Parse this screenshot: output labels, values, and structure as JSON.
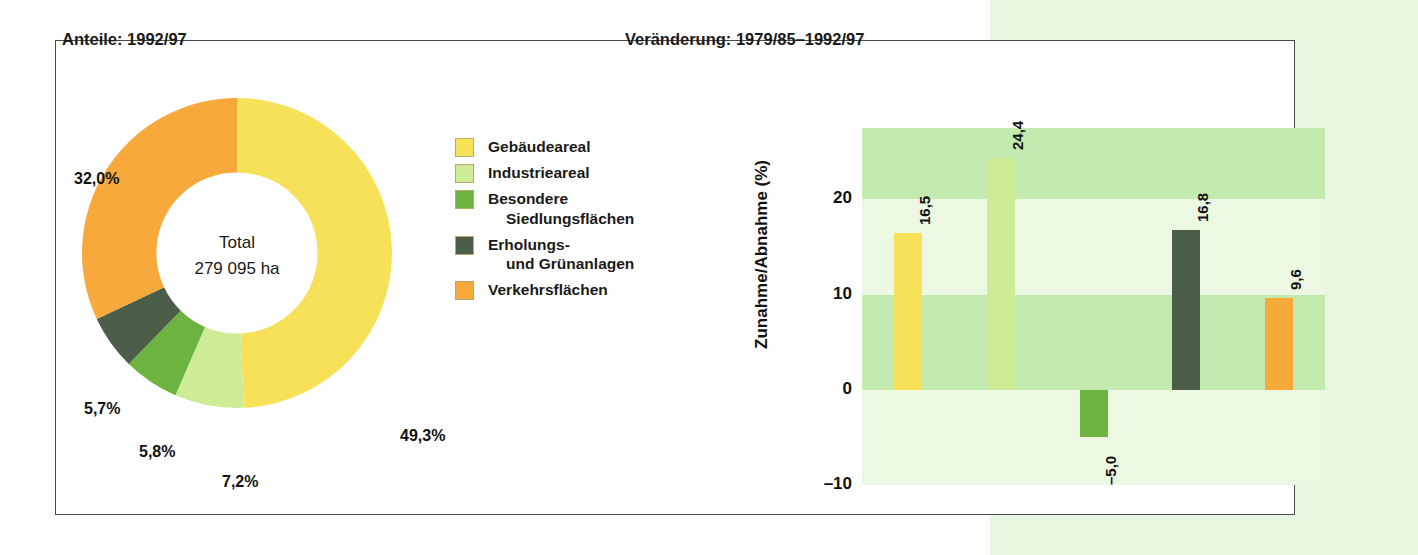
{
  "colors": {
    "page_background": "#ffffff",
    "right_block": "#eaf7e0",
    "panel_border": "#4a4a4a",
    "band_dark": "#c3eaaf",
    "band_light": "#edf8e3",
    "gebaeudeareal": "#f7e158",
    "industrieareal": "#ceeb96",
    "besondere_siedlungsflaechen": "#6cb33f",
    "erholungs_und_gruenanlagen": "#4c5d4a",
    "verkehrsflaechen": "#f7a93c"
  },
  "panels": {
    "left_title": "Anteile: 1992/97",
    "right_title": "Veränderung: 1979/85–1992/97"
  },
  "legend": {
    "items": [
      {
        "label": "Gebäudeareal",
        "continuation": "",
        "color": "#f7e158"
      },
      {
        "label": "Industrieareal",
        "continuation": "",
        "color": "#ceeb96"
      },
      {
        "label": "Besondere",
        "continuation": "Siedlungsflächen",
        "color": "#6cb33f"
      },
      {
        "label": "Erholungs-",
        "continuation": "und Grünanlagen",
        "color": "#4c5d4a"
      },
      {
        "label": "Verkehrsflächen",
        "continuation": "",
        "color": "#f7a93c"
      }
    ]
  },
  "donut": {
    "center_line1": "Total",
    "center_line2": "279 095 ha",
    "labels": {
      "gebaeudeareal": "49,3%",
      "industrieareal": "7,2%",
      "besondere": "5,8%",
      "erholungs": "5,7%",
      "verkehr": "32,0%"
    }
  },
  "bars": {
    "y_axis_title": "Zunahme/Abnahme (%)",
    "ticks": [
      "20",
      "10",
      "0",
      "–10"
    ],
    "values_text": [
      "16,5",
      "24,4",
      "–5,0",
      "16,8",
      "9,6"
    ]
  },
  "chart_data": [
    {
      "type": "pie",
      "title": "Anteile: 1992/97",
      "subtitle": "Total 279 095 ha",
      "legend_position": "right",
      "labels": [
        "Gebäudeareal",
        "Industrieareal",
        "Besondere Siedlungsflächen",
        "Erholungs- und Grünanlagen",
        "Verkehrsflächen"
      ],
      "values": [
        49.3,
        7.2,
        5.8,
        5.7,
        32.0
      ],
      "value_labels": [
        "49,3%",
        "7,2%",
        "5,8%",
        "5,7%",
        "32,0%"
      ],
      "colors": [
        "#f7e158",
        "#ceeb96",
        "#6cb33f",
        "#4c5d4a",
        "#f7a93c"
      ],
      "donut": true,
      "inner_radius_ratio": 0.52,
      "start_angle_deg": 0,
      "direction": "clockwise"
    },
    {
      "type": "bar",
      "title": "Veränderung: 1979/85–1992/97",
      "xlabel": "",
      "ylabel": "Zunahme/Abnahme (%)",
      "categories": [
        "Gebäudeareal",
        "Industrieareal",
        "Besondere Siedlungsflächen",
        "Erholungs- und Grünanlagen",
        "Verkehrsflächen"
      ],
      "values": [
        16.5,
        24.4,
        -5.0,
        16.8,
        9.6
      ],
      "value_labels": [
        "16,5",
        "24,4",
        "–5,0",
        "16,8",
        "9,6"
      ],
      "colors": [
        "#f7e158",
        "#ceeb96",
        "#6cb33f",
        "#4c5d4a",
        "#f7a93c"
      ],
      "ylim": [
        -10,
        27.5
      ],
      "yticks": [
        20,
        10,
        0,
        -10
      ],
      "ytick_labels": [
        "20",
        "10",
        "0",
        "–10"
      ],
      "grid": false,
      "banded_background": true,
      "legend_position": "none"
    }
  ]
}
